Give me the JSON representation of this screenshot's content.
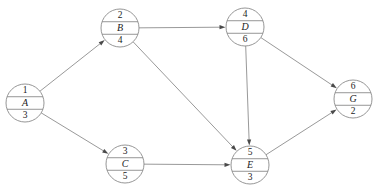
{
  "diagram": {
    "type": "activity-on-node-network",
    "node_layout": "circle split into three rows: top number, middle letter, bottom number",
    "nodes": [
      {
        "id": "A",
        "top": "1",
        "letter": "A",
        "bottom": "3",
        "cx": 25,
        "cy": 103,
        "r": 19
      },
      {
        "id": "B",
        "top": "2",
        "letter": "B",
        "bottom": "4",
        "cx": 120,
        "cy": 28,
        "r": 19
      },
      {
        "id": "C",
        "top": "3",
        "letter": "C",
        "bottom": "5",
        "cx": 125,
        "cy": 164,
        "r": 19
      },
      {
        "id": "D",
        "top": "4",
        "letter": "D",
        "bottom": "6",
        "cx": 245,
        "cy": 27,
        "r": 19
      },
      {
        "id": "E",
        "top": "5",
        "letter": "E",
        "bottom": "3",
        "cx": 250,
        "cy": 165,
        "r": 19
      },
      {
        "id": "G",
        "top": "6",
        "letter": "G",
        "bottom": "2",
        "cx": 353,
        "cy": 99,
        "r": 19
      }
    ],
    "edges": [
      {
        "from": "A",
        "to": "B",
        "directed": true
      },
      {
        "from": "A",
        "to": "C",
        "directed": true
      },
      {
        "from": "B",
        "to": "D",
        "directed": true
      },
      {
        "from": "B",
        "to": "E",
        "directed": true
      },
      {
        "from": "C",
        "to": "E",
        "directed": true
      },
      {
        "from": "D",
        "to": "E",
        "directed": true
      },
      {
        "from": "D",
        "to": "G",
        "directed": true
      },
      {
        "from": "E",
        "to": "G",
        "directed": true
      }
    ],
    "colors": {
      "background": "#ffffff",
      "node_stroke": "#8a8a8a",
      "node_fill": "#ffffff",
      "edge_stroke": "#8d8d8d",
      "arrow_fill": "#4a4a4a",
      "text": "#1b1b1b"
    }
  }
}
